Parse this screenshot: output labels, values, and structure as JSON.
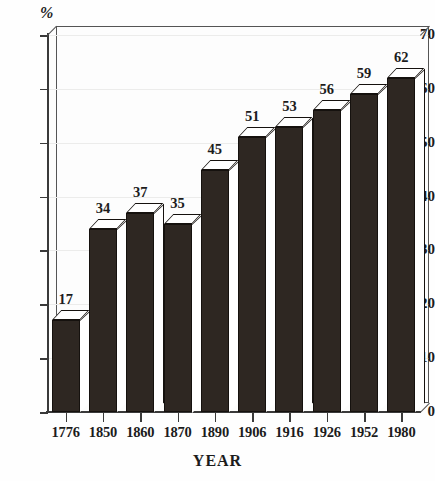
{
  "chart_data": {
    "type": "bar",
    "title": "",
    "xlabel": "YEAR",
    "ylabel": "%",
    "ylim": [
      0,
      70
    ],
    "ytick_step": 10,
    "yticks": [
      0,
      10,
      20,
      30,
      40,
      50,
      60,
      70
    ],
    "grid": true,
    "legend": "none",
    "style": "3d-bar",
    "categories": [
      "1776",
      "1850",
      "1860",
      "1870",
      "1890",
      "1906",
      "1916",
      "1926",
      "1952",
      "1980"
    ],
    "values": [
      17,
      34,
      37,
      35,
      45,
      51,
      53,
      56,
      59,
      62
    ],
    "value_labels": [
      "17",
      "34",
      "37",
      "35",
      "45",
      "51",
      "53",
      "56",
      "59",
      "62"
    ],
    "colors": {
      "bar_front": "#2e2722",
      "bar_top": "#ffffff",
      "bar_side": "#ffffff",
      "bar_outline": "#15110e",
      "axis": "#3a3a3a",
      "grid": "#ececeb",
      "background": "#fdfdfc",
      "text": "#1c1c1c"
    }
  }
}
